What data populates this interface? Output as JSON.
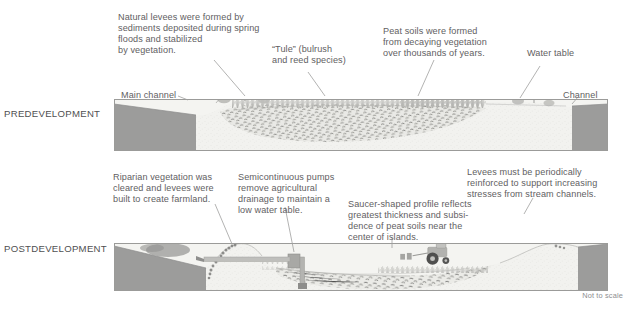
{
  "figure": {
    "footnote": "Not to scale"
  },
  "sections": [
    {
      "id": "predevelopment",
      "label": "PREDEVELOPMENT"
    },
    {
      "id": "postdevelopment",
      "label": "POSTDEVELOPMENT"
    }
  ],
  "callouts": {
    "natural_levees": "Natural levees were formed by\nsediments deposited during spring\nfloods and stabilized\nby vegetation.",
    "tule": "“Tule” (bulrush\nand reed species)",
    "peat_soils": "Peat soils were formed\nfrom decaying vegetation\nover thousands of years.",
    "water_table": "Water table",
    "main_channel": "Main channel",
    "channel": "Channel",
    "riparian": "Riparian vegetation was\ncleared and levees were\nbuilt to create farmland.",
    "pumps": "Semicontinuous pumps\nremove agricultural\ndrainage to maintain a\nlow water table.",
    "saucer": "Saucer-shaped profile reflects\ngreatest thickness and subsi-\ndence of peat soils near the\ncenter of islands.",
    "levee_reinforce": "Levees must be periodically\nreinforced to support increasing\nstresses from stream channels."
  },
  "colors": {
    "text": "#5f6062",
    "section_text": "#4f4f51",
    "footnote_text": "#8d8e90",
    "water": "#9a9a99",
    "water_dark": "#8b8b8a",
    "soil_light": "#efefec",
    "soil_mid": "#e2e2de",
    "levee_fill": "#dddcd7",
    "peat_dark": "#6c6c6a",
    "panel_border": "#9b9b99",
    "leader_line": "#9a9a98",
    "vegetation": "#b9b9b6",
    "tree": "#a9a9a6",
    "pump_gray": "#a3a3a1",
    "tractor": "#b0b0ad"
  },
  "panels": {
    "predevelopment": {
      "x": 114,
      "y": 99,
      "w": 494,
      "h": 52
    },
    "postdevelopment": {
      "x": 114,
      "y": 243,
      "w": 494,
      "h": 48
    }
  }
}
